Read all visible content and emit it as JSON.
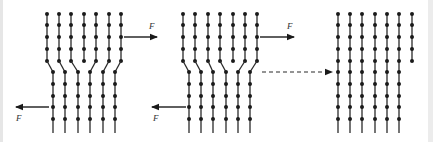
{
  "colors": {
    "line": "#2a2a2a",
    "dot": "#1a1a1a",
    "background": "#ffffff",
    "frame": "#e6e6e6"
  },
  "force_label": "F",
  "dot_rows_upper": [
    14,
    25,
    37,
    49,
    61
  ],
  "dot_rows_lower": [
    72,
    84,
    96,
    107,
    119
  ],
  "line_bottom": 133,
  "panels": [
    {
      "id": "panel-1",
      "upper_columns": [
        47,
        59,
        71,
        84,
        96,
        109,
        121
      ],
      "lower_columns": [
        53,
        65,
        78,
        90,
        103,
        115
      ],
      "extra_half_plane_index": 3,
      "bonds": [
        [
          0,
          0
        ],
        [
          1,
          1
        ],
        [
          2,
          2
        ],
        [
          4,
          3
        ],
        [
          5,
          4
        ],
        [
          6,
          5
        ]
      ],
      "force_right": {
        "x1": 124,
        "x2": 157,
        "y": 37,
        "label_x": 149,
        "label_y": 29
      },
      "force_left": {
        "x1": 49,
        "x2": 16,
        "y": 107,
        "label_x": 16,
        "label_y": 121
      }
    },
    {
      "id": "panel-2",
      "upper_columns": [
        183,
        195,
        208,
        220,
        233,
        245,
        257
      ],
      "lower_columns": [
        189,
        201,
        213,
        226,
        238,
        250
      ],
      "extra_half_plane_index": 4,
      "bonds": [
        [
          0,
          0
        ],
        [
          1,
          1
        ],
        [
          2,
          2
        ],
        [
          3,
          3
        ],
        [
          5,
          4
        ],
        [
          6,
          5
        ]
      ],
      "force_right": {
        "x1": 260,
        "x2": 294,
        "y": 37,
        "label_x": 287,
        "label_y": 29
      },
      "force_left": {
        "x1": 186,
        "x2": 152,
        "y": 107,
        "label_x": 153,
        "label_y": 121
      }
    },
    {
      "id": "panel-3",
      "columns": [
        338,
        350,
        362,
        375,
        387,
        399
      ],
      "surface_step_column": 412
    }
  ],
  "transition_arrow": {
    "x1": 262,
    "x2": 332,
    "y": 72,
    "style": "dashed"
  }
}
